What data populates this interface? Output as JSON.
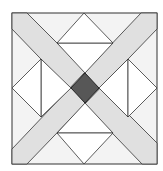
{
  "diagram": {
    "colors": {
      "background": "#f3f3f3",
      "band": "#e2e2e2",
      "white": "#ffffff",
      "center": "#575757",
      "stroke": "#2a2a2a"
    }
  }
}
